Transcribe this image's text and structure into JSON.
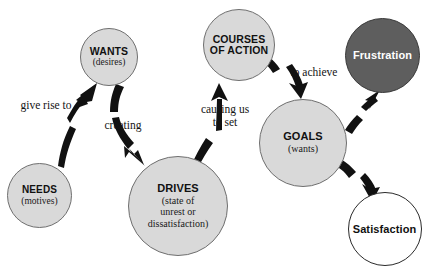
{
  "diagram": {
    "nodes": [
      {
        "id": "needs",
        "title": "NEEDS",
        "subtitle": "(motives)",
        "style": "grey",
        "cx": 39.5,
        "cy": 195.5,
        "r": 32.5,
        "title_size": 10,
        "sub_size": 9.5
      },
      {
        "id": "wants",
        "title": "WANTS",
        "subtitle": "(desires)",
        "style": "grey",
        "cx": 109,
        "cy": 56.5,
        "r": 29,
        "title_size": 10.5,
        "sub_size": 9.5
      },
      {
        "id": "drives",
        "title": "DRIVES",
        "subtitle": "(state of\nunrest or\ndissatisfaction)",
        "style": "grey",
        "cx": 178,
        "cy": 206,
        "r": 50,
        "title_size": 11,
        "sub_size": 10
      },
      {
        "id": "courses-of-action",
        "title": "COURSES\nOF ACTION",
        "subtitle": "",
        "style": "grey",
        "cx": 239,
        "cy": 45,
        "r": 36,
        "title_size": 10.5,
        "sub_size": 9.5
      },
      {
        "id": "goals",
        "title": "GOALS",
        "subtitle": "(wants)",
        "style": "grey",
        "cx": 303,
        "cy": 143,
        "r": 44,
        "title_size": 11,
        "sub_size": 10
      },
      {
        "id": "frustration",
        "title": "Frustration",
        "subtitle": "",
        "style": "dark",
        "cx": 382.5,
        "cy": 55,
        "r": 37.5,
        "title_size": 11,
        "sub_size": 9.5,
        "face": "sad"
      },
      {
        "id": "satisfaction",
        "title": "Satisfaction",
        "subtitle": "",
        "style": "white",
        "cx": 384.5,
        "cy": 229,
        "r": 37,
        "title_size": 11,
        "sub_size": 9.5,
        "face": "happy"
      }
    ],
    "edges": [
      {
        "id": "needs-to-wants",
        "label": "give rise to",
        "from": "needs",
        "to": "wants"
      },
      {
        "id": "wants-to-drives",
        "label": "creating",
        "from": "wants",
        "to": "drives"
      },
      {
        "id": "drives-to-courses",
        "label": "causing us\nto set",
        "from": "drives",
        "to": "courses-of-action"
      },
      {
        "id": "courses-to-goals",
        "label": "to achieve",
        "from": "courses-of-action",
        "to": "goals"
      },
      {
        "id": "goals-to-frustration",
        "label": "",
        "from": "goals",
        "to": "frustration"
      },
      {
        "id": "goals-to-satisfaction",
        "label": "",
        "from": "goals",
        "to": "satisfaction"
      }
    ],
    "labels": [
      {
        "id": "give-rise-to",
        "text": "give rise to",
        "x": 8,
        "y": 99,
        "w": 76,
        "size": 11.5
      },
      {
        "id": "creating",
        "text": "creating",
        "x": 92,
        "y": 119,
        "w": 62,
        "size": 11.5
      },
      {
        "id": "causing-us-to-set",
        "text": "causing us\nto set",
        "x": 193,
        "y": 103,
        "w": 64,
        "size": 11.5
      },
      {
        "id": "to-achieve",
        "text": "to achieve",
        "x": 280,
        "y": 66,
        "w": 68,
        "size": 11.5
      }
    ],
    "colors": {
      "node_fill": "#d9d9d9",
      "node_stroke": "#6f6f6f",
      "dark_fill": "#5e5e5e",
      "arrow": "#111111",
      "text": "#141414",
      "light_text": "#ffffff",
      "background": "#ffffff"
    }
  }
}
